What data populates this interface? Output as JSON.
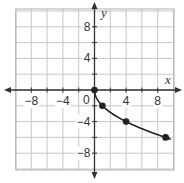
{
  "chart_data": {
    "type": "line",
    "title": "",
    "xlabel": "x",
    "ylabel": "y",
    "xlim": [
      -10,
      10
    ],
    "ylim": [
      -10,
      10
    ],
    "grid": true,
    "grid_step": 2,
    "x_ticks": [
      -8,
      -4,
      4,
      8
    ],
    "y_ticks": [
      8,
      4,
      -4,
      -8
    ],
    "origin_label": "0",
    "function": "y = -2√x",
    "series": [
      {
        "name": "curve",
        "points": [
          [
            0,
            0
          ],
          [
            1,
            -2
          ],
          [
            4,
            -4
          ],
          [
            9,
            -6
          ]
        ],
        "end_arrow": true
      }
    ],
    "colors": {
      "grid": "#c8c8c8",
      "axis": "#333333",
      "curve": "#222222",
      "border": "#b0b0b0"
    }
  }
}
